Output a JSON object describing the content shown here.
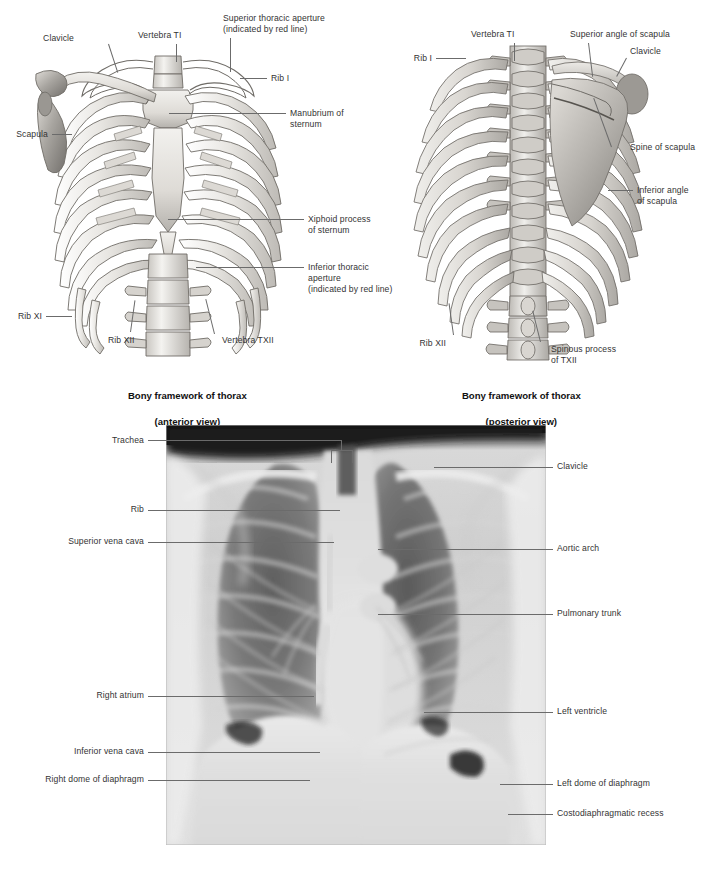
{
  "figure": {
    "background_color": "#ffffff",
    "leader_line_color": "#6b6b6b",
    "label_text_color": "#333333",
    "caption_text_color": "#111111",
    "bone_fill": "#e6e4e0",
    "bone_shade": "#b9b6b1",
    "bone_outline": "#6f6c67"
  },
  "panels": {
    "anterior": {
      "caption_line1": "Bony framework of thorax",
      "caption_line2": "(anterior view)",
      "labels": [
        {
          "id": "clavicle",
          "text": "Clavicle"
        },
        {
          "id": "vertebra-ti",
          "text": "Vertebra TI"
        },
        {
          "id": "superior-thoracic-aperture",
          "text_line1": "Superior thoracic aperture",
          "text_line2": "(indicated by red line)"
        },
        {
          "id": "rib-i",
          "text": "Rib I"
        },
        {
          "id": "manubrium-of-sternum",
          "text_line1": "Manubrium of",
          "text_line2": "sternum"
        },
        {
          "id": "scapula",
          "text": "Scapula"
        },
        {
          "id": "xiphoid-process",
          "text_line1": "Xiphoid process",
          "text_line2": "of sternum"
        },
        {
          "id": "inferior-thoracic-aperture",
          "text_line1": "Inferior thoracic",
          "text_line2": "aperture",
          "text_line3": "(indicated by red line)"
        },
        {
          "id": "rib-xi",
          "text": "Rib XI"
        },
        {
          "id": "rib-xii",
          "text": "Rib XII"
        },
        {
          "id": "vertebra-txii",
          "text": "Vertebra TXII"
        }
      ]
    },
    "posterior": {
      "caption_line1": "Bony framework of thorax",
      "caption_line2": "(posterior view)",
      "labels": [
        {
          "id": "vertebra-ti",
          "text": "Vertebra TI"
        },
        {
          "id": "superior-angle-scapula",
          "text": "Superior angle of scapula"
        },
        {
          "id": "clavicle",
          "text": "Clavicle"
        },
        {
          "id": "rib-i",
          "text": "Rib I"
        },
        {
          "id": "spine-of-scapula",
          "text": "Spine of scapula"
        },
        {
          "id": "inferior-angle-scapula",
          "text_line1": "Inferior angle",
          "text_line2": "of scapula"
        },
        {
          "id": "rib-xii",
          "text": "Rib XII"
        },
        {
          "id": "spinous-process-txii",
          "text_line1": "Spinous process",
          "text_line2": "of TXII"
        }
      ]
    },
    "radiograph": {
      "type": "chest-radiograph-pa-view",
      "labels_left": [
        {
          "id": "trachea",
          "text": "Trachea"
        },
        {
          "id": "rib",
          "text": "Rib"
        },
        {
          "id": "superior-vena-cava",
          "text": "Superior vena cava"
        },
        {
          "id": "right-atrium",
          "text": "Right atrium"
        },
        {
          "id": "inferior-vena-cava",
          "text": "Inferior vena cava"
        },
        {
          "id": "right-dome-of-diaphragm",
          "text": "Right dome of diaphragm"
        }
      ],
      "labels_right": [
        {
          "id": "clavicle",
          "text": "Clavicle"
        },
        {
          "id": "aortic-arch",
          "text": "Aortic arch"
        },
        {
          "id": "pulmonary-trunk",
          "text": "Pulmonary trunk"
        },
        {
          "id": "left-ventricle",
          "text": "Left ventricle"
        },
        {
          "id": "left-dome-of-diaphragm",
          "text": "Left dome of diaphragm"
        },
        {
          "id": "costodiaphragmatic-recess",
          "text": "Costodiaphragmatic recess"
        }
      ]
    }
  }
}
